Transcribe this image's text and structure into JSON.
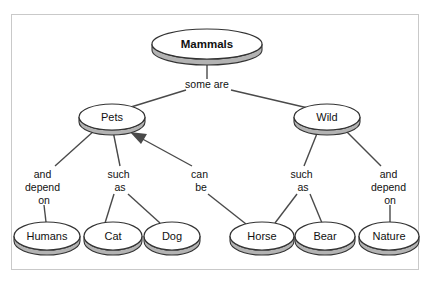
{
  "diagram": {
    "type": "concept-map",
    "colors": {
      "node_fill": "#ffffff",
      "node_shadow": "#b3b3b3",
      "node_stroke": "#333333",
      "connector": "#4a4a4a",
      "frame_border": "#c9c9c9",
      "background": "#ffffff",
      "text": "#111111"
    },
    "nodes": [
      {
        "id": "mammals",
        "label": "Mammals",
        "cx": 207,
        "cy": 44,
        "rx": 55,
        "ry": 15,
        "depth": 6,
        "bold": true
      },
      {
        "id": "pets",
        "label": "Pets",
        "cx": 112,
        "cy": 117,
        "rx": 33,
        "ry": 13,
        "depth": 5,
        "bold": false
      },
      {
        "id": "wild",
        "label": "Wild",
        "cx": 327,
        "cy": 117,
        "rx": 33,
        "ry": 13,
        "depth": 5,
        "bold": false
      },
      {
        "id": "humans",
        "label": "Humans",
        "cx": 47,
        "cy": 236,
        "rx": 33,
        "ry": 14,
        "depth": 5,
        "bold": false
      },
      {
        "id": "cat",
        "label": "Cat",
        "cx": 113,
        "cy": 236,
        "rx": 29,
        "ry": 14,
        "depth": 5,
        "bold": false
      },
      {
        "id": "dog",
        "label": "Dog",
        "cx": 172,
        "cy": 236,
        "rx": 28,
        "ry": 14,
        "depth": 5,
        "bold": false
      },
      {
        "id": "horse",
        "label": "Horse",
        "cx": 262,
        "cy": 236,
        "rx": 32,
        "ry": 14,
        "depth": 5,
        "bold": false
      },
      {
        "id": "bear",
        "label": "Bear",
        "cx": 325,
        "cy": 236,
        "rx": 30,
        "ry": 14,
        "depth": 5,
        "bold": false
      },
      {
        "id": "nature",
        "label": "Nature",
        "cx": 389,
        "cy": 236,
        "rx": 30,
        "ry": 14,
        "depth": 5,
        "bold": false
      }
    ],
    "edge_labels": [
      {
        "id": "some-are",
        "lines": [
          "some are"
        ],
        "x": 207,
        "y": 88
      },
      {
        "id": "and-depend-on-1",
        "lines": [
          "and",
          "depend",
          "on"
        ],
        "x": 44,
        "y": 178
      },
      {
        "id": "such-as-1",
        "lines": [
          "such",
          "as"
        ],
        "x": 120,
        "y": 178
      },
      {
        "id": "can-be",
        "lines": [
          "can",
          "be"
        ],
        "x": 201,
        "y": 178
      },
      {
        "id": "such-as-2",
        "lines": [
          "such",
          "as"
        ],
        "x": 303,
        "y": 178
      },
      {
        "id": "and-depend-on-2",
        "lines": [
          "and",
          "depend",
          "on"
        ],
        "x": 390,
        "y": 178
      }
    ],
    "edges": [
      {
        "from": "mammals",
        "to": "some-are",
        "arrow": false
      },
      {
        "from": "some-are",
        "to": "pets",
        "arrow": false
      },
      {
        "from": "some-are",
        "to": "wild",
        "arrow": false
      },
      {
        "from": "pets",
        "to": "and-depend-on-1",
        "arrow": false
      },
      {
        "from": "and-depend-on-1",
        "to": "humans",
        "arrow": false
      },
      {
        "from": "pets",
        "to": "such-as-1",
        "arrow": false
      },
      {
        "from": "such-as-1",
        "to": "cat",
        "arrow": false
      },
      {
        "from": "such-as-1",
        "to": "dog",
        "arrow": false
      },
      {
        "from": "can-be",
        "to": "pets",
        "arrow": true
      },
      {
        "from": "can-be",
        "to": "horse",
        "arrow": false
      },
      {
        "from": "wild",
        "to": "such-as-2",
        "arrow": false
      },
      {
        "from": "such-as-2",
        "to": "horse",
        "arrow": false
      },
      {
        "from": "such-as-2",
        "to": "bear",
        "arrow": false
      },
      {
        "from": "wild",
        "to": "and-depend-on-2",
        "arrow": false
      },
      {
        "from": "and-depend-on-2",
        "to": "nature",
        "arrow": false
      }
    ]
  }
}
